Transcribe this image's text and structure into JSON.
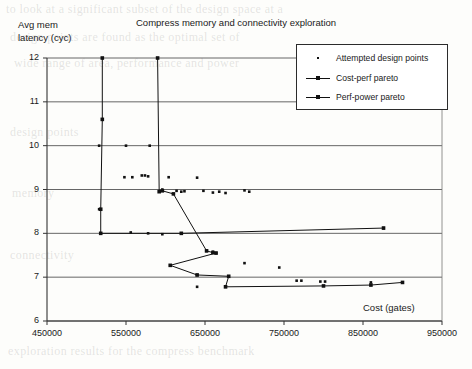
{
  "page": {
    "background_ghost_lines": [
      {
        "text": "to look at a significant subset of the design space at a",
        "x": 6,
        "y": 2
      },
      {
        "text": "design points are found as the optimal set of",
        "x": 10,
        "y": 30
      },
      {
        "text": "wide range of area, performance and power",
        "x": 14,
        "y": 56
      },
      {
        "text": "design points",
        "x": 10,
        "y": 125
      },
      {
        "text": "memory",
        "x": 12,
        "y": 186
      },
      {
        "text": "connectivity",
        "x": 10,
        "y": 248
      },
      {
        "text": "exploration results for the compress benchmark",
        "x": 8,
        "y": 344
      }
    ]
  },
  "chart_data": {
    "type": "scatter",
    "title": "Compress memory and connectivity exploration",
    "ylabel": "Avg mem\nlatency (cyc)",
    "ylabel_line1": "Avg mem",
    "ylabel_line2": "latency (cyc)",
    "xlabel": "Cost (gates)",
    "xlim": [
      450000,
      950000
    ],
    "ylim": [
      6,
      12
    ],
    "xticks": [
      450000,
      550000,
      650000,
      750000,
      850000,
      950000
    ],
    "xtick_labels": [
      "450000",
      "550000",
      "650000",
      "750000",
      "850000",
      "950000"
    ],
    "yticks": [
      6,
      7,
      8,
      9,
      10,
      11,
      12
    ],
    "ytick_labels": [
      "6",
      "7",
      "8",
      "9",
      "10",
      "11",
      "12"
    ],
    "grid": "horizontal",
    "legend_position": "top-right",
    "series": [
      {
        "name": "Attempted design points",
        "marker": "dot",
        "points": [
          [
            520000,
            10.6
          ],
          [
            516000,
            10.0
          ],
          [
            550000,
            10.0
          ],
          [
            580000,
            10.0
          ],
          [
            516000,
            8.55
          ],
          [
            548000,
            9.28
          ],
          [
            558000,
            9.28
          ],
          [
            570000,
            9.32
          ],
          [
            574000,
            9.32
          ],
          [
            578000,
            9.3
          ],
          [
            604000,
            9.28
          ],
          [
            640000,
            9.27
          ],
          [
            596000,
            9.0
          ],
          [
            614000,
            8.97
          ],
          [
            620000,
            8.95
          ],
          [
            624000,
            8.96
          ],
          [
            648000,
            8.97
          ],
          [
            660000,
            8.93
          ],
          [
            668000,
            8.95
          ],
          [
            676000,
            8.92
          ],
          [
            700000,
            8.98
          ],
          [
            706000,
            8.95
          ],
          [
            620000,
            8.0
          ],
          [
            556000,
            8.02
          ],
          [
            578000,
            8.0
          ],
          [
            596000,
            7.98
          ],
          [
            652000,
            7.6
          ],
          [
            660000,
            7.58
          ],
          [
            664000,
            7.55
          ],
          [
            700000,
            7.32
          ],
          [
            744000,
            7.22
          ],
          [
            606000,
            7.27
          ],
          [
            640000,
            7.05
          ],
          [
            680000,
            7.02
          ],
          [
            766000,
            6.92
          ],
          [
            772000,
            6.92
          ],
          [
            796000,
            6.9
          ],
          [
            802000,
            6.9
          ],
          [
            860000,
            6.88
          ],
          [
            900000,
            6.88
          ],
          [
            876000,
            8.12
          ],
          [
            640000,
            6.78
          ],
          [
            676000,
            6.78
          ]
        ]
      },
      {
        "name": "Cost-perf pareto",
        "marker": "square",
        "vertices": [
          [
            520000,
            12.0
          ],
          [
            520000,
            10.6
          ],
          [
            518000,
            8.55
          ],
          [
            518000,
            8.0
          ],
          [
            620000,
            8.0
          ],
          [
            876000,
            8.12
          ]
        ]
      },
      {
        "name": "Perf-power pareto",
        "marker": "square",
        "vertices": [
          [
            590000,
            12.0
          ],
          [
            592000,
            8.95
          ],
          [
            596000,
            8.97
          ],
          [
            610000,
            8.9
          ],
          [
            652000,
            7.6
          ],
          [
            660000,
            7.56
          ],
          [
            664000,
            7.55
          ],
          [
            606000,
            7.27
          ],
          [
            640000,
            7.05
          ],
          [
            680000,
            7.02
          ],
          [
            676000,
            6.78
          ],
          [
            800000,
            6.8
          ],
          [
            860000,
            6.82
          ],
          [
            900000,
            6.88
          ]
        ]
      }
    ],
    "legend_entries": [
      {
        "label": "Attempted design points",
        "key": "dot"
      },
      {
        "label": "Cost-perf pareto",
        "key": "line"
      },
      {
        "label": "Perf-power pareto",
        "key": "line"
      }
    ]
  }
}
